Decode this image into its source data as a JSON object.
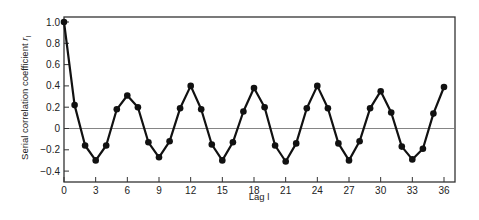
{
  "chart_data": {
    "type": "line",
    "title": "",
    "xlabel": "Lag l",
    "ylabel": "Serial correlation coefficient r_l",
    "ylabel_main": "Serial correlation coefficient ",
    "ylabel_symbol": "r",
    "ylabel_subscript": "l",
    "xlim": [
      0,
      36
    ],
    "ylim": [
      -0.4,
      1.0
    ],
    "x_ticks": [
      0,
      3,
      6,
      9,
      12,
      15,
      18,
      21,
      24,
      27,
      30,
      33,
      36
    ],
    "x_tick_labels": [
      "0",
      "3",
      "6",
      "9",
      "12",
      "15",
      "18",
      "21",
      "24",
      "27",
      "30",
      "33",
      "36"
    ],
    "y_ticks": [
      1.0,
      0.8,
      0.6,
      0.4,
      0.2,
      0,
      -0.2,
      -0.4
    ],
    "y_tick_labels": [
      "1.0",
      "0.8",
      "0.6",
      "0.4",
      "0.2",
      "0",
      "−0.2",
      "−0.4"
    ],
    "grid": false,
    "zero_line": true,
    "legend": null,
    "x": [
      0,
      1,
      2,
      3,
      4,
      5,
      6,
      7,
      8,
      9,
      10,
      11,
      12,
      13,
      14,
      15,
      16,
      17,
      18,
      19,
      20,
      21,
      22,
      23,
      24,
      25,
      26,
      27,
      28,
      29,
      30,
      31,
      32,
      33,
      34,
      35,
      36
    ],
    "series": [
      {
        "name": "r_l",
        "marker": "filled-circle",
        "color": "#111111",
        "values": [
          1.0,
          0.22,
          -0.16,
          -0.3,
          -0.16,
          0.18,
          0.31,
          0.2,
          -0.13,
          -0.27,
          -0.12,
          0.19,
          0.4,
          0.18,
          -0.15,
          -0.3,
          -0.13,
          0.16,
          0.38,
          0.2,
          -0.16,
          -0.31,
          -0.14,
          0.19,
          0.4,
          0.19,
          -0.14,
          -0.3,
          -0.12,
          0.19,
          0.35,
          0.15,
          -0.17,
          -0.29,
          -0.19,
          0.14,
          0.39
        ]
      }
    ]
  },
  "style": {
    "frame_color": "#333333",
    "zero_line_color": "#777777",
    "line_color": "#111111"
  }
}
